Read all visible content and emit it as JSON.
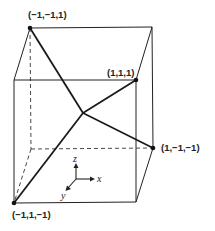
{
  "diagram": {
    "type": "cube-with-tetrahedral-bonds",
    "colors": {
      "stroke": "#222222",
      "background": "#ffffff"
    },
    "vertex_labels": {
      "top_back_left": "(−1,−1,1)",
      "top_front_right": "(1,1,1)",
      "bottom_back_right": "(1,−1,−1)",
      "bottom_front_left": "(−1,1,−1)"
    },
    "axes": {
      "z": "z",
      "x": "x",
      "y": "y"
    }
  }
}
